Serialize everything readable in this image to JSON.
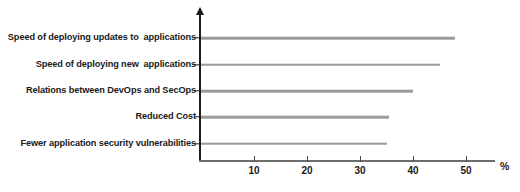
{
  "chart_data": {
    "type": "bar",
    "orientation": "horizontal",
    "title": "",
    "xlabel": "%",
    "ylabel": "",
    "xlim": [
      0,
      56
    ],
    "grid": false,
    "legend": null,
    "categories": [
      "Speed of deploying updates to  applications",
      "Speed of deploying new  applications",
      "Relations between DevOps and SecOps",
      "Reduced Cost",
      "Fewer application security vulnerabilities"
    ],
    "values": [
      48,
      45,
      40,
      35.5,
      35
    ],
    "xticks": [
      10,
      20,
      30,
      40,
      50
    ],
    "xtick_labels": [
      "10",
      "20",
      "30",
      "40",
      "50"
    ],
    "series": [
      {
        "name": "",
        "values": [
          48,
          45,
          40,
          35.5,
          35
        ]
      }
    ],
    "colors": {
      "bar": "#9a9a9a",
      "axis": "#1c1c1c",
      "x_axis": "#6e6e6e",
      "text": "#1a1a1a",
      "background": "#ffffff"
    }
  }
}
